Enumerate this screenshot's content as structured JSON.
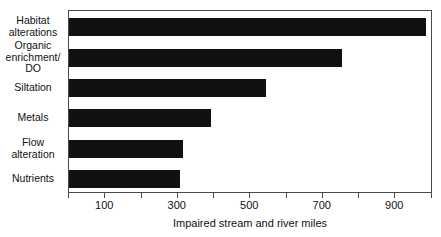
{
  "chart_data": {
    "type": "bar",
    "orientation": "horizontal",
    "title": "",
    "xlabel": "Impaired stream and river miles",
    "ylabel": "",
    "categories": [
      "Habitat alterations",
      "Organic enrichment/ DO",
      "Siltation",
      "Metals",
      "Flow alteration",
      "Nutrients"
    ],
    "category_lines": [
      "Habitat\nalterations",
      "Organic\nenrichment/\nDO",
      "Siltation",
      "Metals",
      "Flow\nalteration",
      "Nutrients"
    ],
    "values": [
      988,
      756,
      546,
      395,
      317,
      309
    ],
    "xlim": [
      0,
      1004
    ],
    "xticks": [
      100,
      300,
      500,
      700,
      900
    ],
    "xticks_all": [
      0,
      100,
      200,
      300,
      400,
      500,
      600,
      700,
      800,
      900,
      1000
    ],
    "xtick_labels": [
      "100",
      "300",
      "500",
      "700",
      "900"
    ],
    "grid": false,
    "legend": false,
    "bar_color": "#111111",
    "frame_color": "#4a4a4a",
    "background": "#ffffff"
  }
}
